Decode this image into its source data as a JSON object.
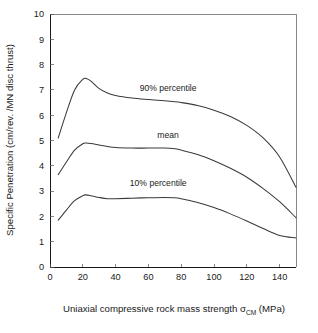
{
  "chart_data": {
    "type": "line",
    "title": "",
    "subtitle": "",
    "xlabel": "Uniaxial compressive rock mass strength σ",
    "xlabel_sub": "CM",
    "xlabel_tail": " (MPa)",
    "ylabel": "Specific Penetration (cm/rev. /MN disc thrust)",
    "xlim": [
      0,
      150
    ],
    "ylim": [
      0,
      10
    ],
    "grid": false,
    "legend_position": "inline-annotations",
    "xticks": [
      0,
      20,
      40,
      60,
      80,
      100,
      120,
      140
    ],
    "xtick_labels": [
      "0",
      "20",
      "40",
      "60",
      "80",
      "100",
      "120",
      "140"
    ],
    "yticks": [
      0,
      1,
      2,
      3,
      4,
      5,
      6,
      7,
      8,
      9,
      10
    ],
    "ytick_labels": [
      "0",
      "1",
      "2",
      "3",
      "4",
      "5",
      "6",
      "7",
      "8",
      "9",
      "10"
    ],
    "x": [
      5,
      10,
      15,
      20,
      22,
      25,
      30,
      35,
      40,
      50,
      60,
      70,
      75,
      80,
      90,
      100,
      110,
      120,
      130,
      140,
      150
    ],
    "series": [
      {
        "name": "90% percentile",
        "label": "90% percentile",
        "label_x": 72,
        "label_y": 6.95,
        "values": [
          5.1,
          6.1,
          7.0,
          7.42,
          7.45,
          7.35,
          7.05,
          6.88,
          6.78,
          6.68,
          6.62,
          6.57,
          6.54,
          6.5,
          6.38,
          6.2,
          5.95,
          5.6,
          5.1,
          4.35,
          3.15
        ]
      },
      {
        "name": "mean",
        "label": "mean",
        "label_x": 72,
        "label_y": 5.1,
        "values": [
          3.65,
          4.15,
          4.62,
          4.87,
          4.9,
          4.88,
          4.82,
          4.76,
          4.72,
          4.7,
          4.7,
          4.7,
          4.68,
          4.62,
          4.45,
          4.2,
          3.9,
          3.55,
          3.1,
          2.58,
          1.95
        ]
      },
      {
        "name": "10% percentile",
        "label": "10% percentile",
        "label_x": 66,
        "label_y": 3.22,
        "values": [
          1.85,
          2.25,
          2.62,
          2.82,
          2.85,
          2.82,
          2.75,
          2.7,
          2.7,
          2.72,
          2.74,
          2.75,
          2.74,
          2.7,
          2.55,
          2.35,
          2.1,
          1.82,
          1.52,
          1.25,
          1.15
        ]
      }
    ]
  },
  "axes": {
    "plot_left_px": 50,
    "plot_right_px": 296,
    "plot_top_px": 14,
    "plot_bottom_px": 267
  }
}
